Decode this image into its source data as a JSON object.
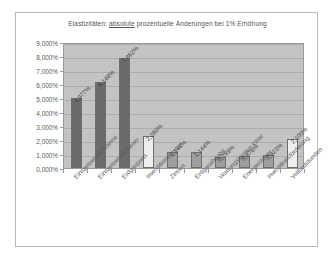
{
  "chart_data": {
    "type": "bar",
    "title": "Elastizitäten: absolute prozentuelle Änderungen  bei 1% Erhöhung",
    "title_parts": {
      "before": "Elastizitäten: ",
      "underlined": "absolute",
      "after": " prozentuelle Änderungen  bei 1% Erhöhung"
    },
    "xlabel": "",
    "ylabel": "",
    "ylim": [
      0,
      9
    ],
    "grid": true,
    "legend": "none",
    "ytick_labels": [
      "9,000%",
      "8,000%",
      "7,000%",
      "6,000%",
      "5,000%",
      "4,000%",
      "3,000%",
      "2,000%",
      "1,000%",
      "0,000%"
    ],
    "ytick_values": [
      9,
      8,
      7,
      6,
      5,
      4,
      3,
      2,
      1,
      0
    ],
    "categories": [
      "Einspeisetarif Wärme",
      "Einspeisetarif Strom",
      "Erdgaspreis",
      "Investitionskosten",
      "Zinsen",
      "Erdgasabgabe",
      "Wartungskosten kWel",
      "Energiesteuer",
      "Investitionsförderung",
      "Volllaststunden"
    ],
    "values": [
      4.977,
      6.148,
      7.862,
      2.28,
      1.144,
      1.144,
      0.789,
      0.876,
      0.923,
      2.1
    ],
    "value_labels": [
      "4,977%",
      "6,148%",
      "7,862%",
      "2,280%",
      "1,144%",
      "1,144%",
      "0,789%",
      "0,876%",
      "0,923%",
      "2,100%"
    ],
    "bar_colors": [
      "#6b6b6b",
      "#6b6b6b",
      "#6b6b6b",
      "#eeeeee",
      "#9e9e9e",
      "#9e9e9e",
      "#9e9e9e",
      "#9e9e9e",
      "#9e9e9e",
      "#eeeeee"
    ],
    "plot_bg_color": "#c3c3c3",
    "frame_bg_color": "#ffffff",
    "gridline_color": "#acacac",
    "axis_color": "#9a9a9a",
    "text_color": "#5a5a5a"
  }
}
